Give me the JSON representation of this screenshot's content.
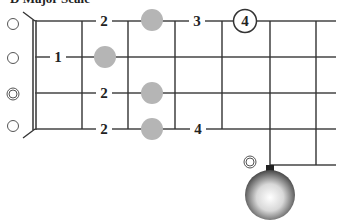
{
  "title": "D Major Scale",
  "instrument": "5-string banjo",
  "colors": {
    "line": "#333333",
    "dot": "#b5b5b5",
    "background": "#ffffff"
  },
  "strings": [
    {
      "index": 1,
      "open_marker": "open-circle",
      "notes": [
        {
          "fret": 2,
          "label": "2"
        },
        {
          "fret": 3,
          "dot": true
        },
        {
          "fret": 4,
          "label": "3"
        },
        {
          "fret": 5,
          "label": "4",
          "circled": true
        }
      ]
    },
    {
      "index": 2,
      "open_marker": "open-circle",
      "notes": [
        {
          "fret": 1,
          "label": "1"
        },
        {
          "fret": 2,
          "dot": true
        }
      ]
    },
    {
      "index": 3,
      "open_marker": "double-circle",
      "notes": [
        {
          "fret": 2,
          "label": "2"
        },
        {
          "fret": 3,
          "dot": true
        }
      ]
    },
    {
      "index": 4,
      "open_marker": "open-circle",
      "notes": [
        {
          "fret": 2,
          "label": "2"
        },
        {
          "fret": 3,
          "dot": true
        },
        {
          "fret": 4,
          "label": "4"
        }
      ]
    },
    {
      "index": 5,
      "open_marker": "double-circle",
      "starts_at_fret": 5,
      "peg": "fifth-string-tuning-peg"
    }
  ],
  "labels": {
    "s1_f2": "2",
    "s1_f4": "3",
    "s1_f5": "4",
    "s2_f1": "1",
    "s3_f2": "2",
    "s4_f2": "2",
    "s4_f4": "4"
  }
}
